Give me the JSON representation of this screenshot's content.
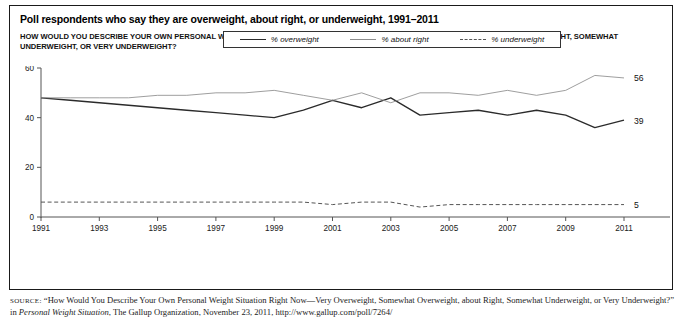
{
  "figure": {
    "title": "Poll respondents who say they are overweight, about right, or underweight, 1991–2011",
    "subtitle": "HOW WOULD YOU DESCRIBE YOUR OWN PERSONAL WEIGHT SITUATON RIGHT NOW—VERY OVERWEIGHT, SOMEWHAT OVERWEIGHT, ABOUT RIGHT, SOMEWHAT UNDERWEIGHT, OR VERY UNDERWEIGHT?"
  },
  "source": {
    "label": "SOURCE:",
    "text_before_italic": " “How Would You Describe Your Own Personal Weight Situation Right Now—Very Overweight, Somewhat Overweight, about Right, Somewhat Underweight, or Very Underweight?” in ",
    "italic_title": "Personal Weight Situation",
    "text_after_italic": ", The Gallup Organization, November 23, 2011, http://www.gallup.com/poll/7264/"
  },
  "chart_data": {
    "type": "line",
    "title": "Poll respondents who say they are overweight, about right, or underweight, 1991–2011",
    "xlabel": "",
    "ylabel": "",
    "xlim": [
      1991,
      2011
    ],
    "ylim": [
      0,
      60
    ],
    "yticks": [
      0,
      20,
      40,
      60
    ],
    "xticks": [
      1991,
      1993,
      1995,
      1997,
      1999,
      2001,
      2003,
      2005,
      2007,
      2009,
      2011
    ],
    "grid": false,
    "legend_position": "top-center",
    "x": [
      1991,
      1992,
      1993,
      1994,
      1995,
      1996,
      1997,
      1998,
      1999,
      2000,
      2001,
      2002,
      2003,
      2004,
      2005,
      2006,
      2007,
      2008,
      2009,
      2010,
      2011
    ],
    "series": [
      {
        "name": "% overweight",
        "style": "solid-thick",
        "color": "#2b2b2b",
        "end_label": "39",
        "values": [
          48,
          47,
          46,
          45,
          44,
          43,
          42,
          41,
          40,
          43,
          47,
          44,
          48,
          41,
          42,
          43,
          41,
          43,
          41,
          36,
          39
        ]
      },
      {
        "name": "% about right",
        "style": "solid-thin",
        "color": "#8d8d8d",
        "end_label": "56",
        "values": [
          48,
          48,
          48,
          48,
          49,
          49,
          50,
          50,
          51,
          49,
          47,
          50,
          46,
          50,
          50,
          49,
          51,
          49,
          51,
          57,
          56
        ]
      },
      {
        "name": "% underweight",
        "style": "dashed",
        "color": "#555555",
        "end_label": "5",
        "values": [
          6,
          6,
          6,
          6,
          6,
          6,
          6,
          6,
          6,
          6,
          5,
          6,
          6,
          4,
          5,
          5,
          5,
          5,
          5,
          5,
          5
        ]
      }
    ]
  }
}
